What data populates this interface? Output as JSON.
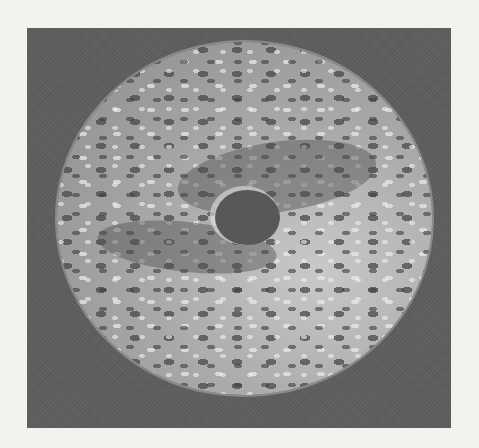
{
  "image": {
    "subject": "corroded pitted metal disc with central hole",
    "style": "grayscale halftone photograph",
    "colors": {
      "paper": "#f3f2ef",
      "frame_background": "#5e5e5e",
      "disc_light": "#c9c9c9",
      "disc_mid": "#a9a9a9",
      "pit_dark": "#4a4a4a",
      "center_hole": "#585858"
    }
  }
}
